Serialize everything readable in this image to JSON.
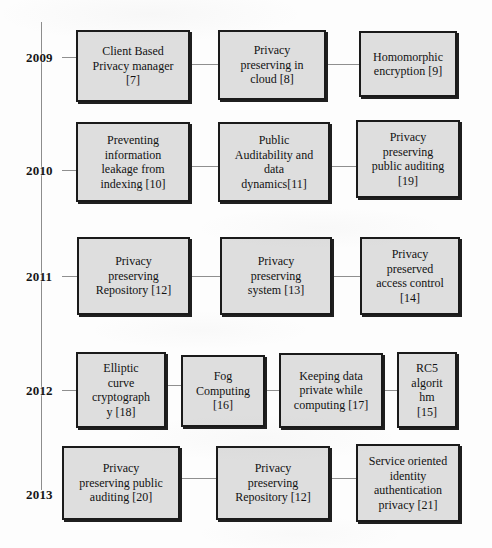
{
  "diagram": {
    "type": "timeline",
    "title": "",
    "axis": {
      "orientation": "vertical",
      "color": "#8d8d8d"
    },
    "colors": {
      "background": "#fdfdfd",
      "node_fill": "#dedede",
      "node_border": "#1a1a1a",
      "connector": "#8f8f8f",
      "text": "#121212"
    },
    "rows": [
      {
        "year": "2009",
        "nodes": [
          {
            "label": "Client Based\nPrivacy manager\n[7]",
            "ref": "[7]"
          },
          {
            "label": "Privacy\npreserving in\ncloud [8]",
            "ref": "[8]"
          },
          {
            "label": "Homomorphic\nencryption [9]",
            "ref": "[9]"
          }
        ]
      },
      {
        "year": "2010",
        "nodes": [
          {
            "label": "Preventing\ninformation\nleakage from\nindexing [10]",
            "ref": "[10]"
          },
          {
            "label": "Public\nAuditability and\ndata\ndynamics[11]",
            "ref": "[11]"
          },
          {
            "label": "Privacy\npreserving\npublic auditing\n[19]",
            "ref": "[19]"
          }
        ]
      },
      {
        "year": "2011",
        "nodes": [
          {
            "label": "Privacy\npreserving\nRepository [12]",
            "ref": "[12]"
          },
          {
            "label": "Privacy\npreserving\nsystem [13]",
            "ref": "[13]"
          },
          {
            "label": "Privacy\npreserved\naccess control\n[14]",
            "ref": "[14]"
          }
        ]
      },
      {
        "year": "2012",
        "nodes": [
          {
            "label": "Elliptic\ncurve\ncryptograph\ny [18]",
            "ref": "[18]"
          },
          {
            "label": "Fog\nComputing\n[16]",
            "ref": "[16]"
          },
          {
            "label": "Keeping data\nprivate while\ncomputing [17]",
            "ref": "[17]"
          },
          {
            "label": "RC5\nalgorit\nhm\n[15]",
            "ref": "[15]"
          }
        ]
      },
      {
        "year": "2013",
        "nodes": [
          {
            "label": "Privacy\npreserving public\nauditing [20]",
            "ref": "[20]"
          },
          {
            "label": "Privacy\npreserving\nRepository [12]",
            "ref": "[12]"
          },
          {
            "label": "Service oriented\nidentity\nauthentication\nprivacy [21]",
            "ref": "[21]"
          }
        ]
      }
    ]
  }
}
